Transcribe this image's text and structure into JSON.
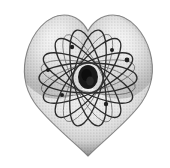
{
  "image": {
    "title": "Atom Heart",
    "alt_text": "Grayscale halftone drawing of a heart containing an atom with many elliptical electron orbits",
    "width": 170,
    "height": 168,
    "background_color": "#ffffff",
    "style": "halftone-dither-grayscale-clipart"
  },
  "heart": {
    "label": "heart-shape",
    "fill_light_color": "#f2f2f2",
    "fill_mid_color": "#c9c9c9",
    "fill_dark_color": "#8c8c8c",
    "outline_color": "#707070",
    "left_edge_x": 25,
    "right_edge_x": 153,
    "top_y": 14,
    "bottom_tip_x": 88,
    "bottom_tip_y": 156,
    "notch_x": 88,
    "notch_y": 31
  },
  "atom": {
    "label": "atom-diagram",
    "orbit_count": 7,
    "orbit_color": "#2b2b2b",
    "orbit_stroke_width": 1.3,
    "center_x": 88,
    "center_y": 78,
    "orbit_radius_x": 49,
    "orbit_radius_y": 15,
    "orbit_angles_deg": [
      0,
      25.7,
      51.4,
      77.1,
      102.9,
      128.6,
      154.3
    ],
    "nucleus": {
      "label": "nucleus",
      "color": "#1a1a1a",
      "center_x": 88,
      "center_y": 77,
      "radius_x": 10,
      "radius_y": 12
    },
    "electrons": [
      {
        "label": "electron-1",
        "x": 127,
        "y": 60,
        "r": 2.4
      },
      {
        "label": "electron-2",
        "x": 72,
        "y": 47,
        "r": 2.2
      },
      {
        "label": "electron-3",
        "x": 62,
        "y": 95,
        "r": 2.0
      },
      {
        "label": "electron-4",
        "x": 106,
        "y": 104,
        "r": 2.2
      },
      {
        "label": "electron-5",
        "x": 48,
        "y": 70,
        "r": 2.0
      },
      {
        "label": "electron-6",
        "x": 112,
        "y": 50,
        "r": 2.0
      }
    ]
  }
}
